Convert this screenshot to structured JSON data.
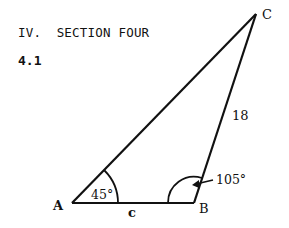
{
  "section": {
    "heading": "IV.  SECTION FOUR",
    "problem_number": "4.1"
  },
  "figure": {
    "type": "triangle",
    "vertices": {
      "A": {
        "label": "A"
      },
      "B": {
        "label": "B"
      },
      "C": {
        "label": "C"
      }
    },
    "angles": {
      "A": "45°",
      "B": "105°"
    },
    "sides": {
      "AB": "c",
      "BC": "18"
    },
    "line_color": "#111111"
  }
}
